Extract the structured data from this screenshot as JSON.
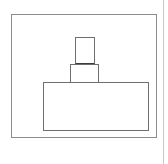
{
  "document": {
    "title": "Stacked Rectangles Diagram",
    "background_color": "#ffffff",
    "width": 168,
    "height": 164
  },
  "page_edge": {
    "name": "page-right-border",
    "color": "#c9c9c9",
    "x": 163
  },
  "diagram": {
    "type": "line-drawing",
    "stroke_color": "#6f6f6f",
    "frame_stroke_color": "#8d8d8d",
    "seam_stroke_color": "#3c3c3c",
    "fill_color": "#ffffff",
    "shapes": [
      {
        "id": "frame",
        "label": "outer-frame",
        "x": 11,
        "y": 14,
        "width": 146,
        "height": 124,
        "stroke": "#8d8d8d",
        "fill": "none"
      },
      {
        "id": "base",
        "label": "base-rectangle",
        "x": 43,
        "y": 82,
        "width": 106,
        "height": 49,
        "stroke": "#6f6f6f",
        "fill": "#ffffff"
      },
      {
        "id": "middle",
        "label": "middle-rectangle",
        "x": 70,
        "y": 64,
        "width": 29,
        "height": 19,
        "stroke": "#6f6f6f",
        "fill": "#ffffff"
      },
      {
        "id": "top",
        "label": "top-rectangle",
        "x": 75,
        "y": 37,
        "width": 20,
        "height": 27,
        "stroke": "#6f6f6f",
        "fill": "#ffffff"
      }
    ]
  }
}
